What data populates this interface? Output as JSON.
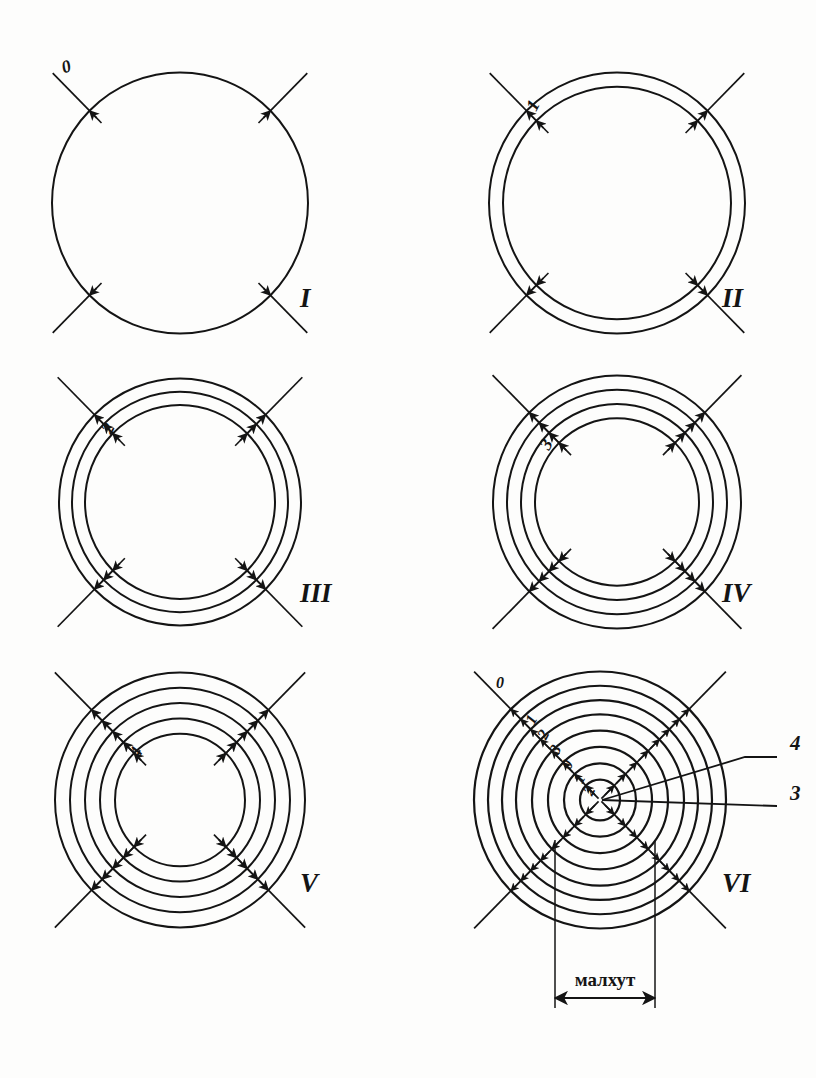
{
  "figure": {
    "background": "#fdfdfc",
    "ink": "#141414",
    "caption": "малхут",
    "panels": [
      {
        "roman": "I",
        "roman_x": 300,
        "roman_y": 307,
        "cx": 180,
        "cy": 203,
        "rings": 1,
        "radii": [
          128
        ],
        "ring_labels": [
          {
            "text": "0",
            "x": 68,
            "y": 72,
            "rot": -18
          }
        ],
        "arrow_heads": 1
      },
      {
        "roman": "II",
        "roman_x": 722,
        "roman_y": 307,
        "cx": 617,
        "cy": 203,
        "rings": 2,
        "radii": [
          128,
          114
        ],
        "ring_labels": [
          {
            "text": "1",
            "x": 538,
            "y": 108,
            "rot": -62
          }
        ],
        "arrow_heads": 2
      },
      {
        "roman": "III",
        "roman_x": 300,
        "roman_y": 602,
        "cx": 180,
        "cy": 502,
        "rings": 3,
        "radii": [
          121,
          108,
          95
        ],
        "ring_labels": [
          {
            "text": "2",
            "x": 113,
            "y": 431,
            "rot": -62
          }
        ],
        "arrow_heads": 3
      },
      {
        "roman": "IV",
        "roman_x": 722,
        "roman_y": 602,
        "cx": 617,
        "cy": 502,
        "rings": 4,
        "radii": [
          124,
          110,
          96,
          82
        ],
        "ring_labels": [
          {
            "text": "3",
            "x": 551,
            "y": 447,
            "rot": -62
          }
        ],
        "arrow_heads": 4
      },
      {
        "roman": "V",
        "roman_x": 300,
        "roman_y": 892,
        "cx": 180,
        "cy": 800,
        "rings": 5,
        "radii": [
          125,
          110,
          95,
          80,
          65
        ],
        "ring_labels": [
          {
            "text": "4",
            "x": 141,
            "y": 755,
            "rot": -62
          }
        ],
        "arrow_heads": 5
      },
      {
        "roman": "VI",
        "roman_x": 722,
        "roman_y": 892,
        "cx": 600,
        "cy": 800,
        "rings": 8,
        "radii": [
          126,
          112,
          98,
          84,
          68,
          52,
          36,
          20
        ],
        "ring_labels": [
          {
            "text": "0",
            "x": 500,
            "y": 688,
            "rot": 0
          },
          {
            "text": "1",
            "x": 536,
            "y": 722,
            "rot": -62
          },
          {
            "text": "2",
            "x": 548,
            "y": 737,
            "rot": -62
          },
          {
            "text": "3",
            "x": 560,
            "y": 752,
            "rot": -62
          },
          {
            "text": "0",
            "x": 572,
            "y": 767,
            "rot": -62
          },
          {
            "text": "1",
            "x": 584,
            "y": 781,
            "rot": -62
          },
          {
            "text": "2",
            "x": 594,
            "y": 793,
            "rot": -62
          }
        ],
        "arrow_heads": 8,
        "leaders": [
          {
            "label": "4",
            "label_x": 790,
            "label_y": 750,
            "line": "M602,800 L745,757 L777,757"
          },
          {
            "label": "3",
            "label_x": 790,
            "label_y": 800,
            "line": "M602,800 L777,806"
          }
        ],
        "dimension": {
          "label": "малхут",
          "label_x": 605,
          "label_y": 986,
          "left_x": 555,
          "right_x": 655,
          "ext_top": 840,
          "ext_bottom": 1008,
          "arrow_y": 998
        }
      }
    ]
  }
}
